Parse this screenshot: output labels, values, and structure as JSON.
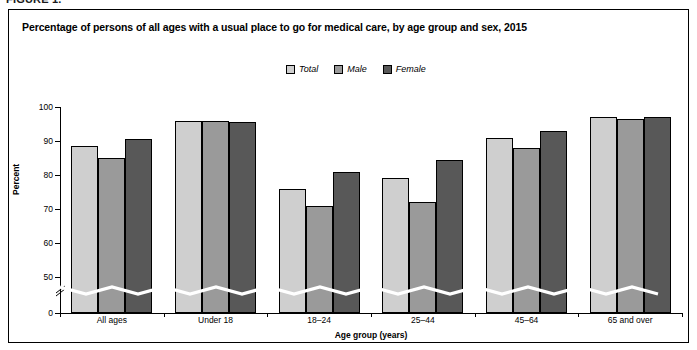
{
  "figure": {
    "label": "FIGURE 1."
  },
  "chart_data": {
    "type": "bar",
    "title": "Percentage of persons of all ages with a usual place to go for medical care, by age group and sex, 2015",
    "xlabel": "Age group (years)",
    "ylabel": "Percent",
    "categories": [
      "All ages",
      "Under 18",
      "18–24",
      "25–44",
      "45–64",
      "65 and over"
    ],
    "series": [
      {
        "name": "Total",
        "color": "#cfcfcf",
        "values": [
          88.5,
          96.0,
          76.0,
          79.0,
          91.0,
          97.0
        ]
      },
      {
        "name": "Male",
        "color": "#9a9a9a",
        "values": [
          85.0,
          96.0,
          71.0,
          72.0,
          88.0,
          96.5
        ]
      },
      {
        "name": "Female",
        "color": "#585858",
        "values": [
          90.5,
          95.5,
          81.0,
          84.5,
          93.0,
          97.0
        ]
      }
    ],
    "ylim": [
      0,
      100
    ],
    "yticks": [
      0,
      50,
      60,
      70,
      80,
      90,
      100
    ],
    "ytick_labels": [
      "0",
      "50",
      "60",
      "70",
      "80",
      "90",
      "100"
    ],
    "y_axis_break": true,
    "y_axis_break_value": 45,
    "grid": false,
    "legend_position": "top-center"
  }
}
